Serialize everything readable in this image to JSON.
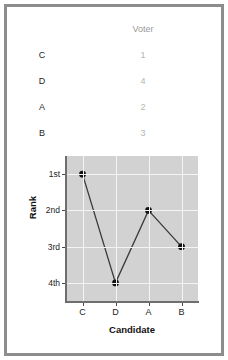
{
  "table": {
    "headers": [
      "",
      "Voter"
    ],
    "voter_header": "Voter",
    "rows": [
      {
        "candidate": "C",
        "voter_rank": "1"
      },
      {
        "candidate": "D",
        "voter_rank": "4"
      },
      {
        "candidate": "A",
        "voter_rank": "2"
      },
      {
        "candidate": "B",
        "voter_rank": "3"
      }
    ]
  },
  "chart_data": {
    "type": "line",
    "title": "",
    "xlabel": "Candidate",
    "ylabel": "Rank",
    "categories": [
      "C",
      "D",
      "A",
      "B"
    ],
    "values": [
      1,
      4,
      2,
      3
    ],
    "ytick_labels": [
      "1st",
      "2nd",
      "3rd",
      "4th"
    ],
    "ytick_values": [
      1,
      2,
      3,
      4
    ],
    "ylim": [
      0.5,
      4.5
    ],
    "y_inverted": true,
    "grid": true,
    "legend": "none",
    "marker": "filled-circle",
    "plot_background": "#d2d2d2",
    "grid_color": "#f4f4f4",
    "line_color": "#3a3a3a",
    "marker_color": "#111111"
  },
  "colors": {
    "frame": "#8d8d8d",
    "page_background": "#ffffff",
    "table_header_text": "#9a9a9a",
    "table_candidate_text": "#262626",
    "table_rank_text": "#b4b4b4"
  }
}
